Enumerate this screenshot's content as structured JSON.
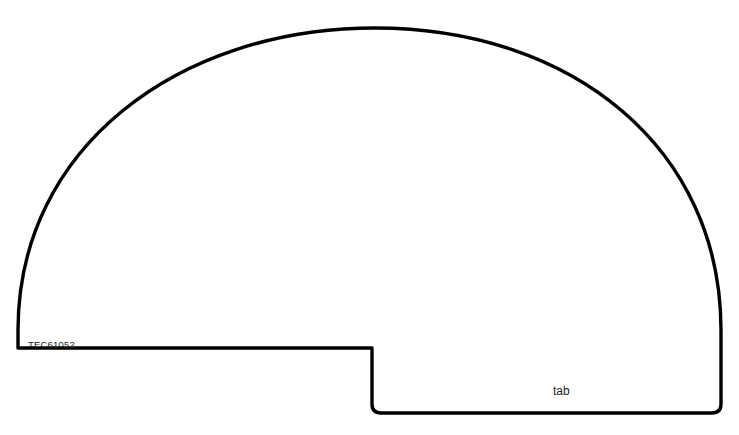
{
  "page": {
    "background_color": "#ffffff",
    "width": 739,
    "height": 435,
    "header_note": "clipped header text"
  },
  "drawing": {
    "title": "Dome shaped part outline with tab",
    "stroke_color": "#000000",
    "fill_color": "none",
    "stroke_width": 3.4,
    "part_number": "TEC61052",
    "tab_label": "tab",
    "geometry": {
      "apex": [
        375,
        28
      ],
      "left_base": [
        18,
        348
      ],
      "right_base": [
        721,
        348
      ],
      "baseline_y": 348,
      "notch_x": 372,
      "tab_bottom_y": 413,
      "tab_right_x": 719,
      "corner_radius": 9
    }
  }
}
